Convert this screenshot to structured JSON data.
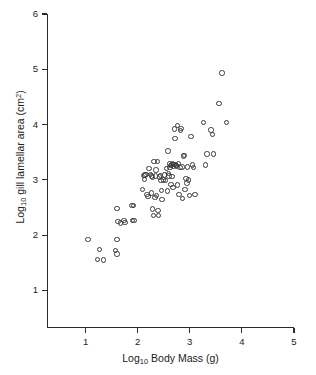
{
  "chart_data": {
    "type": "scatter",
    "title": "",
    "xlabel": "Log10 Body Mass (g)",
    "ylabel": "Log10 gill lamellar area (cm2)",
    "xlabel_parts": {
      "prefix": "Log",
      "sub": "10",
      "suffix": " Body Mass (g)"
    },
    "ylabel_parts": {
      "prefix": "Log",
      "sub": "10",
      "mid": " gill lamellar area (cm",
      "sup": "2",
      "suffix": ")"
    },
    "xlim": [
      0.26,
      5.0
    ],
    "ylim": [
      0.32,
      6.0
    ],
    "xticks": [
      1,
      2,
      3,
      4,
      5
    ],
    "yticks": [
      1,
      2,
      3,
      4,
      5,
      6
    ],
    "xtick_labels": [
      "1",
      "2",
      "3",
      "4",
      "5"
    ],
    "ytick_labels": [
      "1",
      "2",
      "3",
      "4",
      "5",
      "6"
    ],
    "grid": false,
    "legend": null,
    "marker": "open-circle",
    "marker_color": "#3a3a3a",
    "n_points": 95,
    "points": [
      [
        1.05,
        1.92
      ],
      [
        1.27,
        1.74
      ],
      [
        1.23,
        1.56
      ],
      [
        1.34,
        1.55
      ],
      [
        1.6,
        2.48
      ],
      [
        1.6,
        1.92
      ],
      [
        1.57,
        1.72
      ],
      [
        1.6,
        1.66
      ],
      [
        1.62,
        2.25
      ],
      [
        1.67,
        2.22
      ],
      [
        1.74,
        2.26
      ],
      [
        1.76,
        2.23
      ],
      [
        1.89,
        2.54
      ],
      [
        1.92,
        2.54
      ],
      [
        1.9,
        2.27
      ],
      [
        1.93,
        2.26
      ],
      [
        2.09,
        2.82
      ],
      [
        2.12,
        3.08
      ],
      [
        2.14,
        3.09
      ],
      [
        2.16,
        3.1
      ],
      [
        2.18,
        2.74
      ],
      [
        2.2,
        2.7
      ],
      [
        2.22,
        3.21
      ],
      [
        2.25,
        3.1
      ],
      [
        2.27,
        2.76
      ],
      [
        2.28,
        3.05
      ],
      [
        2.29,
        2.47
      ],
      [
        2.3,
        2.36
      ],
      [
        2.31,
        3.33
      ],
      [
        2.33,
        2.68
      ],
      [
        2.35,
        3.18
      ],
      [
        2.36,
        2.72
      ],
      [
        2.38,
        3.33
      ],
      [
        2.39,
        2.44
      ],
      [
        2.4,
        2.36
      ],
      [
        2.42,
        3.05
      ],
      [
        2.44,
        3.08
      ],
      [
        2.45,
        2.99
      ],
      [
        2.46,
        2.81
      ],
      [
        2.47,
        2.64
      ],
      [
        2.49,
        3.0
      ],
      [
        2.52,
        3.09
      ],
      [
        2.53,
        2.99
      ],
      [
        2.55,
        3.2
      ],
      [
        2.57,
        2.8
      ],
      [
        2.58,
        3.52
      ],
      [
        2.59,
        3.11
      ],
      [
        2.61,
        3.29
      ],
      [
        2.62,
        3.22
      ],
      [
        2.63,
        3.26
      ],
      [
        2.64,
        2.92
      ],
      [
        2.65,
        3.27
      ],
      [
        2.66,
        3.06
      ],
      [
        2.67,
        3.3
      ],
      [
        2.68,
        2.86
      ],
      [
        2.69,
        3.24
      ],
      [
        2.7,
        3.28
      ],
      [
        2.71,
        3.92
      ],
      [
        2.72,
        3.75
      ],
      [
        2.73,
        3.28
      ],
      [
        2.74,
        3.26
      ],
      [
        2.75,
        3.25
      ],
      [
        2.76,
        2.91
      ],
      [
        2.77,
        3.98
      ],
      [
        2.78,
        3.3
      ],
      [
        2.79,
        2.74
      ],
      [
        2.81,
        3.22
      ],
      [
        2.82,
        3.89
      ],
      [
        2.83,
        3.93
      ],
      [
        2.85,
        3.23
      ],
      [
        2.86,
        2.66
      ],
      [
        2.88,
        3.43
      ],
      [
        2.9,
        3.44
      ],
      [
        2.91,
        2.83
      ],
      [
        2.93,
        3.02
      ],
      [
        2.95,
        2.94
      ],
      [
        2.96,
        3.23
      ],
      [
        2.98,
        3.0
      ],
      [
        3.0,
        2.72
      ],
      [
        3.02,
        3.78
      ],
      [
        3.05,
        3.27
      ],
      [
        3.07,
        3.22
      ],
      [
        3.1,
        2.74
      ],
      [
        3.26,
        4.04
      ],
      [
        3.3,
        3.27
      ],
      [
        3.33,
        3.47
      ],
      [
        3.41,
        3.9
      ],
      [
        3.44,
        3.82
      ],
      [
        3.46,
        3.47
      ],
      [
        3.56,
        4.38
      ],
      [
        3.62,
        4.93
      ],
      [
        3.7,
        4.04
      ],
      [
        2.34,
        3.07
      ],
      [
        2.26,
        3.07
      ],
      [
        2.6,
        3.07
      ],
      [
        2.13,
        3.01
      ]
    ]
  }
}
